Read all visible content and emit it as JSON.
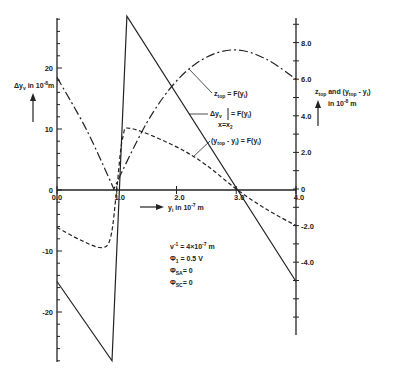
{
  "chart_data": {
    "type": "line",
    "title": "",
    "xlabel": "y_i in 10^-7 m",
    "ylabel_left": "Δy_v in 10^-8 m",
    "ylabel_right": "z_top and (y_top - y_i) in 10^-8 m",
    "xlim": [
      0.0,
      4.0
    ],
    "ylim_left": [
      -28,
      28
    ],
    "ylim_right": [
      -9.2,
      9.2
    ],
    "x_ticks": [
      "0.0",
      "1.0",
      "2.0",
      "3.0",
      "4.0"
    ],
    "left_ticks": [
      "20",
      "10",
      "0",
      "-10",
      "-20"
    ],
    "right_ticks": [
      "8.0",
      "6.0",
      "4.0",
      "2.0",
      "0",
      "-2.0",
      "-4.0"
    ],
    "grid": false,
    "series": [
      {
        "name": "Δy_v |_(x=x2) = F(y_i)",
        "axis": "left",
        "style": "solid",
        "x": [
          0.0,
          0.92,
          1.17,
          4.0
        ],
        "y": [
          -15.0,
          -28.0,
          28.5,
          -15.0
        ]
      },
      {
        "name": "z_top = F(y_i)",
        "axis": "right",
        "style": "dash-dot",
        "x": [
          0.0,
          0.5,
          0.95,
          1.5,
          2.0,
          2.5,
          3.0,
          3.5,
          4.0
        ],
        "y": [
          6.1,
          3.2,
          0.0,
          3.6,
          5.9,
          7.2,
          7.6,
          7.1,
          6.0
        ]
      },
      {
        "name": "(y_top - y_i) = F(y_i)",
        "axis": "right",
        "style": "dashed",
        "x": [
          0.0,
          0.4,
          0.75,
          0.9,
          1.0,
          1.1,
          1.25,
          2.0,
          2.5,
          3.0,
          3.5,
          4.0
        ],
        "y": [
          -2.1,
          -2.8,
          -3.2,
          -2.6,
          0.0,
          2.8,
          3.3,
          2.3,
          1.3,
          0.0,
          -1.1,
          -2.0
        ]
      }
    ],
    "annotations": [
      "z_top = F(y_i)",
      "Δy_v |_(x=x2) = F(y_i)",
      "(y_top - y_i) = F(y_i)",
      "ν^-1 = 4×10^-7 m",
      "Φ1 = 0.5 V",
      "Φ_SA = 0",
      "Φ_SC = 0"
    ]
  },
  "labels": {
    "left_axis_main": "Δy",
    "left_axis_sub": "v",
    "left_axis_unit": "in 10",
    "left_axis_exp": "-8",
    "left_axis_m": "m",
    "x_axis_main": "y",
    "x_axis_sub": "i",
    "x_axis_unit": "in 10",
    "x_axis_exp": "-7",
    "x_axis_m": "m",
    "right_axis_line1": "z",
    "right_axis_line1_sub": "top",
    "right_axis_line1_rest": " and (y",
    "right_axis_line1_sub2": "top",
    "right_axis_line1_end": " - y",
    "right_axis_line1_sub3": "i",
    "right_axis_line1_close": ")",
    "right_axis_line2": "in 10",
    "right_axis_line2_exp": "-8",
    "right_axis_line2_m": " m",
    "legend_ztop": "z",
    "legend_ztop_sub": "top",
    "legend_ztop_rest": " = F(y",
    "legend_ztop_sub2": "i",
    "legend_ztop_close": ")",
    "legend_dyv": "Δy",
    "legend_dyv_sub": "v",
    "legend_dyv_rest": " = F(y",
    "legend_dyv_sub2": "i",
    "legend_dyv_close": ")",
    "legend_dyv_cond": "x=x",
    "legend_dyv_cond_sub": "2",
    "legend_ytop": "(y",
    "legend_ytop_sub": "top",
    "legend_ytop_rest": " - y",
    "legend_ytop_sub2": "i",
    "legend_ytop_close": ") = F(y",
    "legend_ytop_sub3": "i",
    "legend_ytop_end": ")",
    "param1": "ν",
    "param1_exp": "-1",
    "param1_rest": " = 4×10",
    "param1_exp2": "-7",
    "param1_m": " m",
    "param2": "Φ",
    "param2_sub": "1",
    "param2_rest": " = 0.5 V",
    "param3": "Φ",
    "param3_sub": "SA",
    "param3_rest": "= 0",
    "param4": "Φ",
    "param4_sub": "SC",
    "param4_rest": "= 0"
  }
}
